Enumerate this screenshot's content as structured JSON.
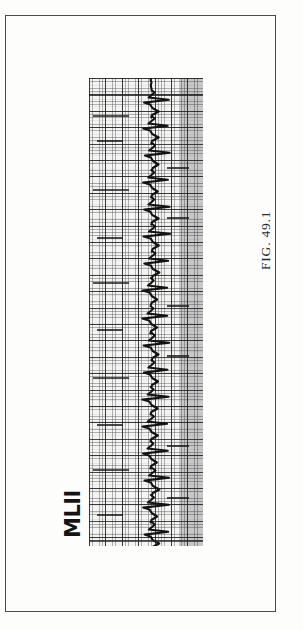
{
  "page": {
    "background_color": "#fdfdfc",
    "frame_color": "#4a4a4d"
  },
  "figure": {
    "caption": "FIG. 49.1",
    "caption_rotation_deg": -90
  },
  "lead": {
    "label": "MLII",
    "label_rotation_deg": -90
  },
  "chart_data": {
    "type": "line",
    "title": "FIG. 49.1",
    "subtitle": "",
    "xlabel": "",
    "ylabel": "MLII",
    "legend": [],
    "grid": true,
    "grid_minor_px": 3.28,
    "grid_major_px": 16.4,
    "orientation": "rotated-90-ccw",
    "signal_name": "MLII",
    "recording_type": "electrocardiogram-rhythm-strip",
    "trace_color": "#121212",
    "paper_color": "#f4f4f2",
    "grid_color_minor": "#46464b",
    "grid_color_major": "#1e1e23",
    "beat_count": 17,
    "x": [
      0,
      1,
      2,
      3,
      4,
      5,
      6,
      7,
      8,
      9,
      10,
      11,
      12,
      13,
      14,
      15,
      16
    ],
    "beat_positions_px": [
      24,
      50,
      77,
      104,
      131,
      158,
      185,
      212,
      240,
      267,
      294,
      321,
      348,
      375,
      402,
      429,
      456
    ],
    "values": [
      1.0,
      1.0,
      1.0,
      1.0,
      1.0,
      1.0,
      1.0,
      1.0,
      1.0,
      1.0,
      1.0,
      1.0,
      1.0,
      1.0,
      1.0,
      1.0,
      1.0
    ],
    "xlim": [
      0,
      468
    ],
    "ylim": [
      0,
      114
    ],
    "annotations": []
  }
}
